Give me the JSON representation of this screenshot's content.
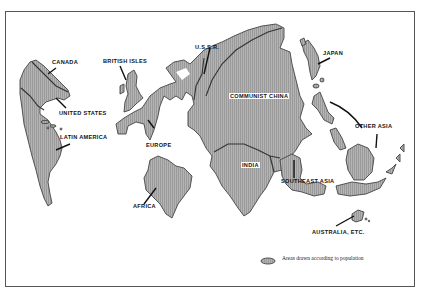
{
  "map": {
    "type": "cartogram",
    "theme": "Areas drawn according to population",
    "colors": {
      "land_fill": "#a8a8a8",
      "land_stroke": "#444444",
      "background": "#ffffff",
      "text": "#111111"
    },
    "regions": [
      {
        "id": "canada",
        "label": "CANADA"
      },
      {
        "id": "united-states",
        "label": "UNITED STATES"
      },
      {
        "id": "latin-america",
        "label": "LATIN AMERICA"
      },
      {
        "id": "british-isles",
        "label": "BRITISH ISLES"
      },
      {
        "id": "europe",
        "label": "EUROPE"
      },
      {
        "id": "ussr",
        "label": "U.S.S.R."
      },
      {
        "id": "communist-china",
        "label": "COMMUNIST CHINA"
      },
      {
        "id": "japan",
        "label": "JAPAN"
      },
      {
        "id": "other-asia",
        "label": "OTHER ASIA"
      },
      {
        "id": "india",
        "label": "INDIA"
      },
      {
        "id": "southeast-asia",
        "label": "SOUTHEAST ASIA"
      },
      {
        "id": "africa",
        "label": "AFRICA"
      },
      {
        "id": "australia",
        "label": "AUSTRALIA, ETC."
      }
    ],
    "legend": {
      "text": "Areas drawn according to population"
    }
  }
}
